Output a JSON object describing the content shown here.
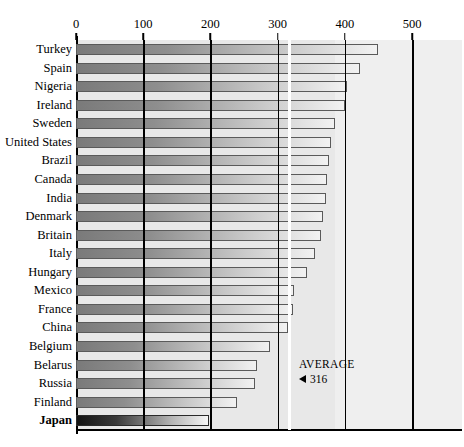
{
  "chart_data": {
    "type": "bar",
    "orientation": "horizontal",
    "title": "",
    "xlabel": "",
    "ylabel": "",
    "xlim": [
      0,
      500
    ],
    "xticks": [
      0,
      100,
      200,
      300,
      400,
      500
    ],
    "xtick_labels": [
      "0",
      "100",
      "200",
      "300",
      "400",
      "500"
    ],
    "grid": true,
    "grid_axis": "x",
    "legend": false,
    "categories": [
      "Turkey",
      "Spain",
      "Nigeria",
      "Ireland",
      "Sweden",
      "United States",
      "Brazil",
      "Canada",
      "India",
      "Denmark",
      "Britain",
      "Italy",
      "Hungary",
      "Mexico",
      "France",
      "China",
      "Belgium",
      "Belarus",
      "Russia",
      "Finland",
      "Japan"
    ],
    "values": [
      450,
      423,
      403,
      400,
      385,
      380,
      376,
      373,
      372,
      367,
      364,
      356,
      344,
      324,
      323,
      316,
      288,
      270,
      266,
      239,
      198
    ],
    "highlight_category": "Japan",
    "annotations": [
      {
        "name": "average-marker",
        "label": "AVERAGE",
        "value": 316,
        "value_text": "316",
        "arrow": "left-triangle",
        "line_color": "#ffffff"
      }
    ],
    "colors": {
      "bar_gradient_start": "#7a7a7a",
      "bar_gradient_end": "#f2f2f2",
      "bar_border": "#5a5a5a",
      "highlight_gradient_start": "#131313",
      "highlight_gradient_end": "#f6f6f6",
      "plot_background": "#e8e8e8",
      "plot_background_right": "#efefef",
      "gridline": "#000000",
      "axis": "#000000",
      "text": "#000000"
    }
  }
}
